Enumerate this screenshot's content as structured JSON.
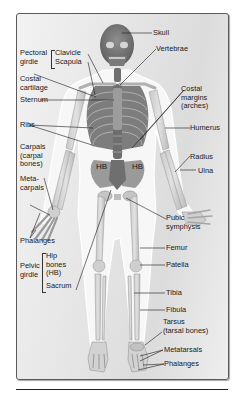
{
  "diagram": {
    "colors": {
      "frame_bg": "#e6e6e6",
      "bone_light": "#d8d8d8",
      "bone_dark": "#8a8a8a",
      "body_outline": "#ffffff",
      "label_text": "#1a1a1a"
    },
    "labels": {
      "skull": "Skull",
      "vertebrae": "Vertebrae",
      "pectoral_girdle": [
        "Pectoral",
        "girdle"
      ],
      "clavicle": "Clavicle",
      "scapula": "Scapula",
      "costal_cartilage": [
        "Costal",
        "cartilage"
      ],
      "sternum": "Sternum",
      "costal_margins": [
        "Costal",
        "margins",
        "(arches)"
      ],
      "ribs": "Ribs",
      "humerus": "Humerus",
      "carpals": [
        "Carpals",
        "(carpal",
        "bones)"
      ],
      "radius": "Radius",
      "ulna": "Ulna",
      "hb_left": "HB",
      "hb_right": "HB",
      "metacarpals": [
        "Meta-",
        "carpals"
      ],
      "pubic_symphysis": [
        "Pubic",
        "symphysis"
      ],
      "phalanges_hand": "Phalanges",
      "femur": "Femur",
      "pelvic_girdle": [
        "Pelvic",
        "girdle"
      ],
      "hip_bones": [
        "Hip",
        "bones",
        "(HB)"
      ],
      "sacrum": "Sacrum",
      "patella": "Patella",
      "tibia": "Tibia",
      "fibula": "Fibula",
      "tarsus": [
        "Tarsus",
        "(tarsal bones)"
      ],
      "metatarsals": "Metatarsals",
      "phalanges_foot": "Phalanges"
    }
  }
}
